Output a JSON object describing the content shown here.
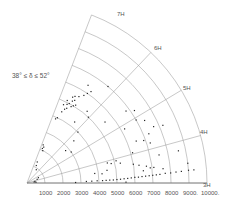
{
  "chart_data": {
    "type": "scatter",
    "subtype": "polar-wedge (redshift cone diagram)",
    "title": "",
    "annotation": "38° ≤ δ ≤ 52°",
    "xlabel": "",
    "ylabel": "",
    "radial_axis": {
      "ticks": [
        1000,
        2000,
        3000,
        4000,
        5000,
        6000,
        7000,
        8000,
        9000,
        10000
      ],
      "tick_labels": [
        "1000",
        "2000",
        "3000",
        "4000",
        "5000",
        "6000",
        "7000",
        "8000",
        "9000.",
        "10000."
      ],
      "range": [
        0,
        10000
      ]
    },
    "angular_axis": {
      "ticks": [
        "3H",
        "4H",
        "5H",
        "6H",
        "7H"
      ],
      "angles_deg": [
        0,
        15.3,
        31,
        46.5,
        69
      ]
    },
    "grid": true,
    "legend": null,
    "points_note": "Points given as [radial value, angle in degrees from 3H baseline]; estimated from pixel positions",
    "points": [
      [
        400,
        8
      ],
      [
        500,
        5
      ],
      [
        450,
        12
      ],
      [
        600,
        20
      ],
      [
        700,
        25
      ],
      [
        900,
        55
      ],
      [
        1100,
        62
      ],
      [
        1300,
        64
      ],
      [
        2000,
        64
      ],
      [
        2100,
        66
      ],
      [
        2200,
        65
      ],
      [
        2300,
        67
      ],
      [
        3900,
        66
      ],
      [
        4000,
        65
      ],
      [
        4400,
        64
      ],
      [
        4600,
        63
      ],
      [
        4700,
        62
      ],
      [
        4800,
        65
      ],
      [
        4900,
        63
      ],
      [
        5000,
        62
      ],
      [
        5100,
        64
      ],
      [
        5200,
        61
      ],
      [
        5300,
        60
      ],
      [
        5400,
        62
      ],
      [
        5500,
        61
      ],
      [
        5600,
        59
      ],
      [
        5000,
        59
      ],
      [
        4900,
        60
      ],
      [
        5100,
        58
      ],
      [
        5800,
        57
      ],
      [
        6000,
        56
      ],
      [
        6200,
        55
      ],
      [
        6400,
        58
      ],
      [
        7000,
        50
      ],
      [
        4300,
        52
      ],
      [
        5200,
        50
      ],
      [
        4000,
        45
      ],
      [
        3500,
        42
      ],
      [
        3000,
        35
      ],
      [
        2800,
        40
      ],
      [
        5000,
        47
      ],
      [
        5500,
        38
      ],
      [
        6800,
        36
      ],
      [
        7200,
        34
      ],
      [
        7000,
        30
      ],
      [
        7400,
        28
      ],
      [
        6200,
        29
      ],
      [
        7700,
        24
      ],
      [
        7300,
        22
      ],
      [
        8200,
        23
      ],
      [
        6900,
        20
      ],
      [
        6500,
        21
      ],
      [
        7200,
        18
      ],
      [
        6100,
        16
      ],
      [
        4600,
        14
      ],
      [
        4800,
        13
      ],
      [
        5100,
        14
      ],
      [
        5300,
        12
      ],
      [
        6000,
        10
      ],
      [
        7500,
        12
      ],
      [
        8600,
        12
      ],
      [
        9000,
        7
      ],
      [
        6700,
        8
      ],
      [
        6900,
        7
      ],
      [
        7100,
        7
      ],
      [
        7600,
        6
      ],
      [
        6300,
        9
      ],
      [
        6500,
        6
      ],
      [
        3300,
        1.5
      ],
      [
        3600,
        1.6
      ],
      [
        3900,
        1.8
      ],
      [
        4200,
        1.8
      ],
      [
        4400,
        1.9
      ],
      [
        4600,
        2
      ],
      [
        4800,
        2
      ],
      [
        5000,
        2.2
      ],
      [
        5200,
        2.3
      ],
      [
        5400,
        2.5
      ],
      [
        5600,
        2.6
      ],
      [
        5800,
        2.8
      ],
      [
        6000,
        3
      ],
      [
        6200,
        3
      ],
      [
        6400,
        3.2
      ],
      [
        6600,
        3.3
      ],
      [
        6800,
        3.4
      ],
      [
        7000,
        3.5
      ],
      [
        7200,
        3.6
      ],
      [
        7400,
        3.7
      ],
      [
        7700,
        4
      ],
      [
        8000,
        4
      ],
      [
        8300,
        4.2
      ],
      [
        8600,
        4.3
      ],
      [
        9000,
        4.5
      ],
      [
        9300,
        4.5
      ],
      [
        5500,
        0.5
      ],
      [
        2700,
        0.6
      ],
      [
        4500,
        9
      ],
      [
        3800,
        8
      ],
      [
        4200,
        7
      ]
    ]
  },
  "labels": {
    "annotation": "38° ≤ δ ≤ 52°",
    "hours": [
      "3H",
      "4H",
      "5H",
      "6H",
      "7H"
    ],
    "radial": [
      "1000",
      "2000",
      "3000",
      "4000",
      "5000",
      "6000",
      "7000",
      "8000",
      "9000.",
      "10000."
    ]
  }
}
